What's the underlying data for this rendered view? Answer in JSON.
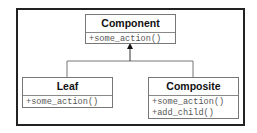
{
  "diagram": {
    "type": "uml-class",
    "classes": [
      {
        "name": "Component",
        "operations": [
          "+some_action()"
        ]
      },
      {
        "name": "Leaf",
        "operations": [
          "+some_action()"
        ]
      },
      {
        "name": "Composite",
        "operations": [
          "+some_action()",
          "+add_child()"
        ]
      }
    ],
    "relations": [
      {
        "from": "Leaf",
        "to": "Component",
        "kind": "generalization"
      },
      {
        "from": "Composite",
        "to": "Component",
        "kind": "generalization"
      }
    ]
  }
}
